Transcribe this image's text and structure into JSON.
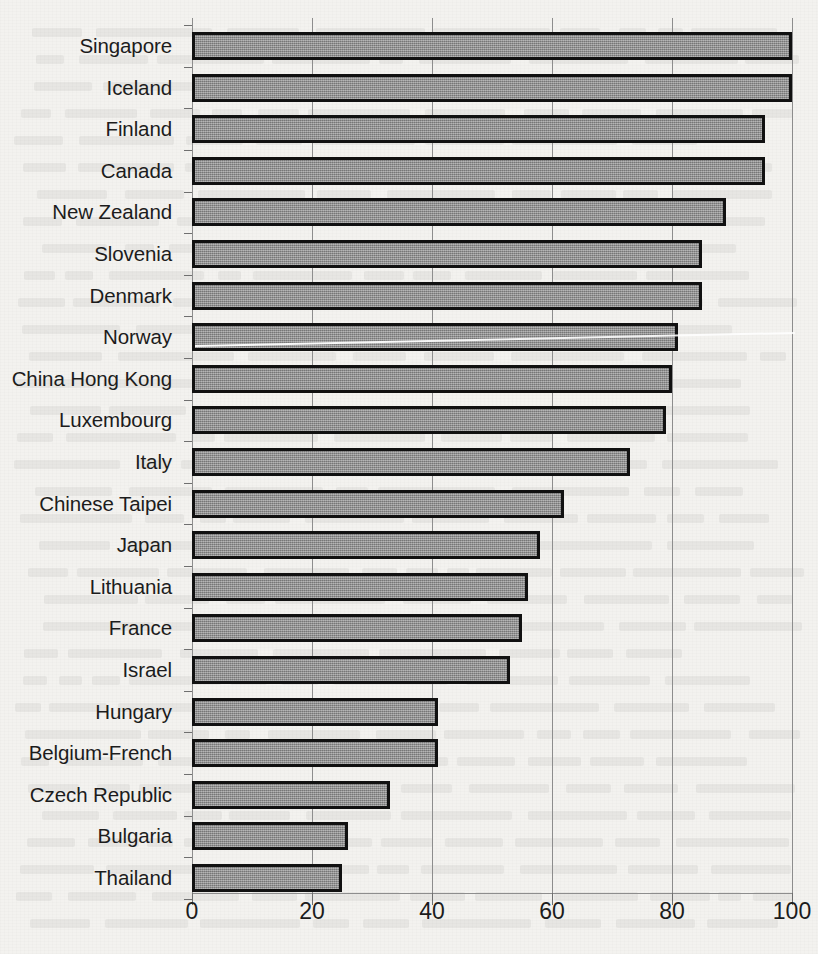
{
  "chart_data": {
    "type": "bar",
    "orientation": "horizontal",
    "title": "",
    "xlabel": "",
    "ylabel": "",
    "xlim": [
      0,
      100
    ],
    "xticks": [
      0,
      20,
      40,
      60,
      80,
      100
    ],
    "xtick_labels": [
      "0",
      "20",
      "40",
      "60",
      "80",
      "100"
    ],
    "grid": true,
    "grid_axis": "x",
    "legend": false,
    "legend_position": "none",
    "bar_fill_color": "#8e8e8e",
    "bar_edge_color": "#111111",
    "background_color": "#f3f2ef",
    "categories": [
      "Singapore",
      "Iceland",
      "Finland",
      "Canada",
      "New Zealand",
      "Slovenia",
      "Denmark",
      "Norway",
      "China Hong Kong",
      "Luxembourg",
      "Italy",
      "Chinese Taipei",
      "Japan",
      "Lithuania",
      "France",
      "Israel",
      "Hungary",
      "Belgium-French",
      "Czech Republic",
      "Bulgaria",
      "Thailand"
    ],
    "values": [
      100,
      100,
      95.5,
      95.5,
      89,
      85,
      85,
      81,
      80,
      79,
      73,
      62,
      58,
      56,
      55,
      53,
      41,
      41,
      33,
      26,
      25
    ]
  },
  "annotations": {
    "scan_artifact": "white diagonal streak across the Norway bar"
  }
}
